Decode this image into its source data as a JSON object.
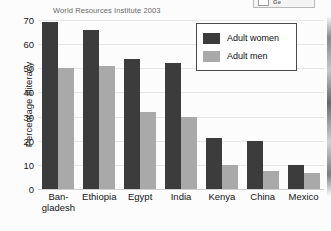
{
  "source_note": "World Resources Institute 2003",
  "top_chip": {
    "label": "Ge",
    "checkbox_icon": "checkbox-icon"
  },
  "legend": {
    "position": "top-right-inside",
    "entries": [
      {
        "label": "Adult women",
        "color": "#3c3c3c",
        "swatch_icon": "legend-swatch-icon"
      },
      {
        "label": "Adult men",
        "color": "#a9a9a9",
        "swatch_icon": "legend-swatch-icon"
      }
    ]
  },
  "chart_data": {
    "type": "bar",
    "title": "",
    "subtitle": "World Resources Institute 2003",
    "xlabel": "",
    "ylabel": "Percentage illiteracy",
    "ylim": [
      0,
      70
    ],
    "ytick_interval": 10,
    "yticks": [
      70,
      60,
      50,
      40,
      30,
      20,
      10,
      0
    ],
    "grid": false,
    "legend_position": "upper right",
    "categories": [
      "Ban-\ngladesh",
      "Ethiopia",
      "Egypt",
      "India",
      "Kenya",
      "China",
      "Mexico"
    ],
    "category_names": [
      "Bangladesh",
      "Ethiopia",
      "Egypt",
      "India",
      "Kenya",
      "China",
      "Mexico"
    ],
    "series": [
      {
        "name": "Adult women",
        "color": "#3c3c3c",
        "values": [
          69,
          66,
          54,
          52,
          21,
          20,
          10
        ]
      },
      {
        "name": "Adult men",
        "color": "#a9a9a9",
        "values": [
          50,
          51,
          32,
          30,
          10,
          7.5,
          6.5
        ]
      }
    ]
  }
}
